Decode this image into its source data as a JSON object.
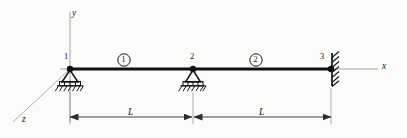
{
  "figure": {
    "type": "structural-beam-diagram",
    "colors": {
      "background": "#fbfbf9",
      "beam": "#101114",
      "axis": "#8d8d8d",
      "support": "#131418",
      "dimension": "#44464b",
      "text": "#15161a"
    }
  },
  "axes": {
    "x_label": "x",
    "y_label": "y",
    "z_label": "z"
  },
  "nodes": [
    {
      "id": "1",
      "label": "1",
      "support": "pin-roller"
    },
    {
      "id": "2",
      "label": "2",
      "support": "pin-roller"
    },
    {
      "id": "3",
      "label": "3",
      "support": "fixed"
    }
  ],
  "elements": [
    {
      "id": "1",
      "label": "1",
      "from": "1",
      "to": "2"
    },
    {
      "id": "2",
      "label": "2",
      "from": "2",
      "to": "3"
    }
  ],
  "dimensions": [
    {
      "id": "span-1",
      "label": "L",
      "from": "1",
      "to": "2"
    },
    {
      "id": "span-2",
      "label": "L",
      "from": "2",
      "to": "3"
    }
  ]
}
